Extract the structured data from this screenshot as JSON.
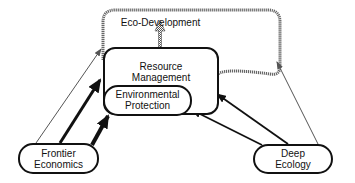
{
  "diagram": {
    "nodes": [
      {
        "id": "eco-development",
        "label": "Eco-Development"
      },
      {
        "id": "resource-management",
        "label_line1": "Resource",
        "label_line2": "Management"
      },
      {
        "id": "environmental-protection",
        "label_line1": "Environmental",
        "label_line2": "Protection"
      },
      {
        "id": "frontier-economics",
        "label_line1": "Frontier",
        "label_line2": "Economics"
      },
      {
        "id": "deep-ecology",
        "label_line1": "Deep",
        "label_line2": "Ecology"
      }
    ],
    "edges": [
      {
        "from": "frontier-economics",
        "to": "eco-development",
        "style": "thin"
      },
      {
        "from": "frontier-economics",
        "to": "resource-management",
        "style": "thick"
      },
      {
        "from": "frontier-economics",
        "to": "environmental-protection",
        "style": "thick"
      },
      {
        "from": "deep-ecology",
        "to": "eco-development",
        "style": "thin"
      },
      {
        "from": "deep-ecology",
        "to": "resource-management",
        "style": "medium"
      },
      {
        "from": "deep-ecology",
        "to": "environmental-protection",
        "style": "medium"
      },
      {
        "from": "resource-management",
        "to": "eco-development",
        "style": "hatched"
      }
    ],
    "colors": {
      "line": "#111111",
      "dotted": "#777777",
      "background": "#ffffff"
    }
  }
}
